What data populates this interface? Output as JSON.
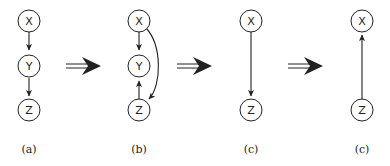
{
  "panels": [
    {
      "id": "a",
      "caption": "(a)",
      "nodes": [
        "X",
        "Y",
        "Z"
      ],
      "edges": [
        [
          "X",
          "Y"
        ],
        [
          "Y",
          "Z"
        ]
      ]
    },
    {
      "id": "b",
      "caption": "(b)",
      "nodes": [
        "X",
        "Y",
        "Z"
      ],
      "edges": [
        [
          "X",
          "Y"
        ],
        [
          "Z",
          "Y"
        ],
        [
          "X",
          "Z"
        ]
      ]
    },
    {
      "id": "c1",
      "caption": "(c)",
      "nodes": [
        "X",
        "Z"
      ],
      "edges": [
        [
          "X",
          "Z"
        ]
      ]
    },
    {
      "id": "c2",
      "caption": "(c)",
      "nodes": [
        "X",
        "Z"
      ],
      "edges": [
        [
          "Z",
          "X"
        ]
      ]
    }
  ],
  "transition_arrows": 3
}
